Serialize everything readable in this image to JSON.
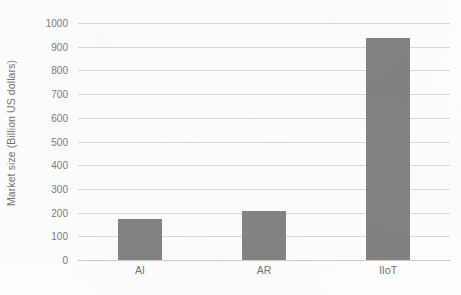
{
  "chart_data": {
    "type": "bar",
    "title": "",
    "subtitle": "",
    "categories": [
      "AI",
      "AR",
      "IIoT"
    ],
    "values": [
      173,
      207,
      937
    ],
    "series": [
      {
        "name": "Market size",
        "values": [
          173,
          207,
          937
        ],
        "color": "#808080"
      }
    ],
    "xlabel": "",
    "ylabel": "Market size (Billion US dollars)",
    "ylim": [
      0,
      1000
    ],
    "ytick_labels": [
      "0",
      "100",
      "200",
      "300",
      "400",
      "500",
      "600",
      "700",
      "800",
      "900",
      "1000"
    ],
    "ytick_values": [
      0,
      100,
      200,
      300,
      400,
      500,
      600,
      700,
      800,
      900,
      1000
    ],
    "grid": "horizontal",
    "legend": "none",
    "annotations": [],
    "colors": {
      "bar": "#808080",
      "gridline": "#d8d8d8",
      "baseline": "#c9c9c9",
      "text": "#6f6f6f",
      "background": "#ffffff"
    }
  }
}
